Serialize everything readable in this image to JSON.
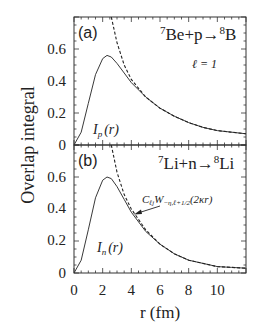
{
  "chart_data": [
    {
      "type": "line",
      "panel": "(a)",
      "title": "7Be+p→8B",
      "annotation": "ℓ = 1",
      "xlabel": "r (fm)",
      "ylabel": "Overlap integral",
      "xlim": [
        0,
        12
      ],
      "ylim": [
        0,
        0.8
      ],
      "xticks": [
        0,
        2,
        4,
        6,
        8,
        10
      ],
      "yticks": [
        0,
        0.2,
        0.4,
        0.6
      ],
      "series": [
        {
          "name": "I_p(r)",
          "style": "solid",
          "x": [
            0,
            0.5,
            1.0,
            1.5,
            2.0,
            2.3,
            2.6,
            3.0,
            3.5,
            4.0,
            5.0,
            6.0,
            7.0,
            8.0,
            9.0,
            10.0,
            11.0,
            12.0
          ],
          "y": [
            0,
            0.08,
            0.26,
            0.44,
            0.54,
            0.56,
            0.55,
            0.51,
            0.45,
            0.39,
            0.3,
            0.23,
            0.18,
            0.14,
            0.11,
            0.09,
            0.08,
            0.07
          ]
        },
        {
          "name": "asymptotic",
          "style": "dashed",
          "x": [
            2.6,
            3.0,
            3.5,
            4.0,
            5.0,
            6.0,
            7.0,
            8.0,
            9.0,
            10.0,
            11.0,
            12.0
          ],
          "y": [
            0.8,
            0.64,
            0.5,
            0.41,
            0.3,
            0.23,
            0.18,
            0.14,
            0.11,
            0.09,
            0.08,
            0.07
          ]
        }
      ]
    },
    {
      "type": "line",
      "panel": "(b)",
      "title": "7Li+n→8Li",
      "annotation": "C_ℓj W_{-η,ℓ+1/2}(2κr)",
      "xlabel": "r (fm)",
      "ylabel": "Overlap integral",
      "xlim": [
        0,
        12
      ],
      "ylim": [
        0,
        0.8
      ],
      "xticks": [
        0,
        2,
        4,
        6,
        8,
        10
      ],
      "yticks": [
        0,
        0.2,
        0.4,
        0.6
      ],
      "series": [
        {
          "name": "I_n(r)",
          "style": "solid",
          "x": [
            0,
            0.5,
            1.0,
            1.5,
            2.0,
            2.3,
            2.6,
            3.0,
            3.5,
            4.0,
            5.0,
            6.0,
            7.0,
            8.0,
            9.0,
            10.0,
            11.0,
            12.0
          ],
          "y": [
            0,
            0.08,
            0.27,
            0.47,
            0.58,
            0.6,
            0.59,
            0.54,
            0.46,
            0.38,
            0.26,
            0.18,
            0.12,
            0.08,
            0.06,
            0.04,
            0.035,
            0.03
          ]
        },
        {
          "name": "asymptotic",
          "style": "dashed",
          "x": [
            2.6,
            3.0,
            3.5,
            4.0,
            5.0,
            6.0,
            7.0,
            8.0,
            9.0,
            10.0,
            11.0,
            12.0
          ],
          "y": [
            0.8,
            0.63,
            0.49,
            0.4,
            0.27,
            0.18,
            0.12,
            0.08,
            0.06,
            0.04,
            0.035,
            0.03
          ]
        }
      ]
    }
  ],
  "labels": {
    "panel_a": "(a)",
    "panel_b": "(b)",
    "reaction_a_pre": "7",
    "reaction_a_mid": "Be+p→",
    "reaction_a_sup": "8",
    "reaction_a_end": "B",
    "ell": "ℓ = 1",
    "reaction_b_pre": "7",
    "reaction_b_mid": "Li+n→",
    "reaction_b_sup": "8",
    "reaction_b_end": "Li",
    "ip_main": "I",
    "ip_sub": "p",
    "ip_arg": "(r)",
    "in_main": "I",
    "in_sub": "n",
    "in_arg": "(r)",
    "whittaker_C": "C",
    "whittaker_Csub": "ℓj",
    "whittaker_W": "W",
    "whittaker_Wsub": "−η,ℓ+1/2",
    "whittaker_arg": "(2κr)",
    "xlabel": "r (fm)",
    "ylabel": "Overlap integral",
    "xticks": [
      "0",
      "2",
      "4",
      "6",
      "8",
      "10"
    ],
    "yticks": [
      "0",
      "0.2",
      "0.4",
      "0.6"
    ]
  }
}
